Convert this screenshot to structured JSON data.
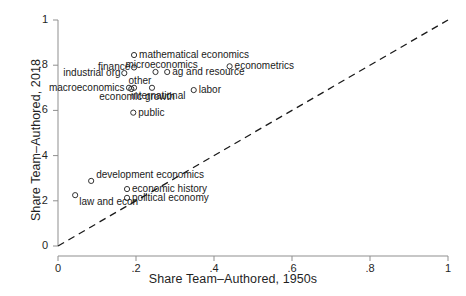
{
  "chart_data": {
    "type": "scatter",
    "title": "",
    "xlabel": "Share Team–Authored, 1950s",
    "ylabel": "Share Team–Authored, 2018",
    "xlim": [
      0,
      1
    ],
    "ylim": [
      0,
      1
    ],
    "xticks": [
      "0",
      ".2",
      ".4",
      ".6",
      ".8",
      "1"
    ],
    "xtick_values": [
      0,
      0.2,
      0.4,
      0.6,
      0.8,
      1
    ],
    "yticks": [
      "0",
      ".2",
      ".4",
      ".6",
      ".8",
      "1"
    ],
    "ytick_values": [
      0,
      0.2,
      0.4,
      0.6,
      0.8,
      1
    ],
    "grid": false,
    "legend": "none",
    "marker": "open-circle",
    "reference_line": {
      "name": "45-degree line",
      "style": "dashed",
      "from": [
        0,
        0
      ],
      "to": [
        1,
        1
      ]
    },
    "points": [
      {
        "label": "mathematical economics",
        "x": 0.195,
        "y": 0.845,
        "label_side": "right"
      },
      {
        "label": "econometrics",
        "x": 0.44,
        "y": 0.795,
        "label_side": "right"
      },
      {
        "label": "microeconomics",
        "x": 0.25,
        "y": 0.77,
        "label_side": "above"
      },
      {
        "label": "ag and resource",
        "x": 0.28,
        "y": 0.77,
        "label_side": "right"
      },
      {
        "label": "finance",
        "x": 0.195,
        "y": 0.79,
        "label_side": "left"
      },
      {
        "label": "industrial org",
        "x": 0.17,
        "y": 0.765,
        "label_side": "left"
      },
      {
        "label": "other",
        "x": 0.195,
        "y": 0.7,
        "label_side": "above"
      },
      {
        "label": "macroeconomics",
        "x": 0.182,
        "y": 0.7,
        "label_side": "left"
      },
      {
        "label": "economic growth",
        "x": 0.188,
        "y": 0.695,
        "label_side": "below"
      },
      {
        "label": "international",
        "x": 0.241,
        "y": 0.7,
        "label_side": "below"
      },
      {
        "label": "labor",
        "x": 0.348,
        "y": 0.69,
        "label_side": "right"
      },
      {
        "label": "public",
        "x": 0.193,
        "y": 0.59,
        "label_side": "right"
      },
      {
        "label": "development economics",
        "x": 0.085,
        "y": 0.288,
        "label_side": "above-right"
      },
      {
        "label": "economic history",
        "x": 0.177,
        "y": 0.252,
        "label_side": "right"
      },
      {
        "label": "political economy",
        "x": 0.177,
        "y": 0.213,
        "label_side": "right"
      },
      {
        "label": "law and econ",
        "x": 0.044,
        "y": 0.225,
        "label_side": "below-right"
      }
    ]
  },
  "style": {
    "axis_color": "#8f8f8f",
    "marker_color": "#333333",
    "line_color": "#1a1a1a",
    "text_color": "#1f1f1f"
  }
}
